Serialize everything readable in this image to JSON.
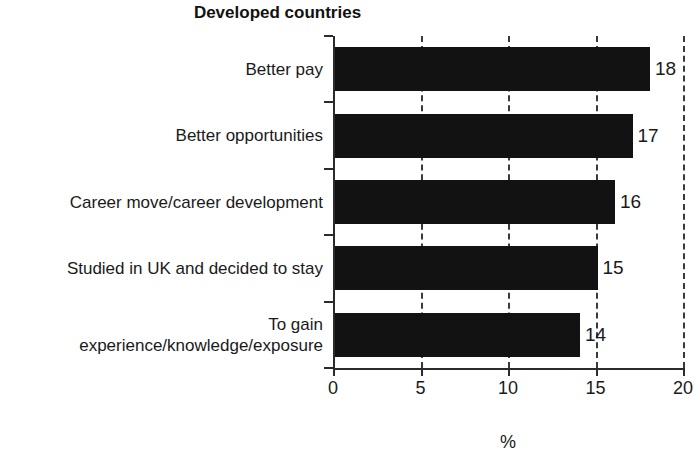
{
  "chart_data": {
    "type": "bar",
    "orientation": "horizontal",
    "title": "Developed countries",
    "xlabel": "%",
    "ylabel": "",
    "xlim": [
      0,
      20
    ],
    "xticks": [
      0,
      5,
      10,
      15,
      20
    ],
    "xtick_labels": [
      "0",
      "5",
      "10",
      "15",
      "20"
    ],
    "grid": "vertical-dashed",
    "legend": "none",
    "bar_color": "#121212",
    "categories": [
      "Better pay",
      "Better opportunities",
      "Career move/career development",
      "Studied in UK and decided to stay",
      "To gain\nexperience/knowledge/exposure"
    ],
    "values": [
      18,
      17,
      16,
      15,
      14
    ],
    "value_labels": [
      "18",
      "17",
      "16",
      "15",
      "14"
    ]
  }
}
